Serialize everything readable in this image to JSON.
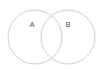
{
  "figure": {
    "type": "venn-diagram",
    "background_color": "#ffffff",
    "width": 101,
    "height": 70
  },
  "chart_data": {
    "type": "venn",
    "title": "",
    "sets": [
      {
        "label": "A",
        "name": "set-a",
        "center_x": 35,
        "center_y": 37,
        "radius": 27,
        "label_x": 32,
        "label_y": 25,
        "stroke_color": "#c8c8c8",
        "fill_color": "#ffffff"
      },
      {
        "label": "B",
        "name": "set-b",
        "center_x": 68,
        "center_y": 37,
        "radius": 27,
        "label_x": 68,
        "label_y": 25,
        "stroke_color": "#c8c8c8",
        "fill_color": "#ffffff"
      }
    ],
    "intersection": {
      "label": "",
      "present": true,
      "upper_crossing": [
        52,
        15
      ],
      "lower_crossing": [
        52,
        59
      ]
    },
    "legend": null,
    "grid": false,
    "label_color": "#4a4a4a",
    "stroke_width": 0.9
  }
}
